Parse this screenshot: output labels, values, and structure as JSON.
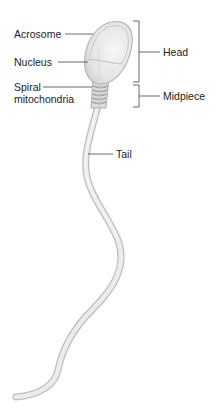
{
  "diagram": {
    "labels": {
      "acrosome": "Acrosome",
      "nucleus": "Nucleus",
      "spiral_line1": "Spiral",
      "spiral_line2": "mitochondria",
      "tail": "Tail"
    },
    "regions": {
      "head": "Head",
      "midpiece": "Midpiece"
    },
    "colors": {
      "cell_fill": "#e8e8e8",
      "cell_stroke": "#b5b5b5",
      "leader_line": "#444444",
      "text": "#222222"
    }
  }
}
